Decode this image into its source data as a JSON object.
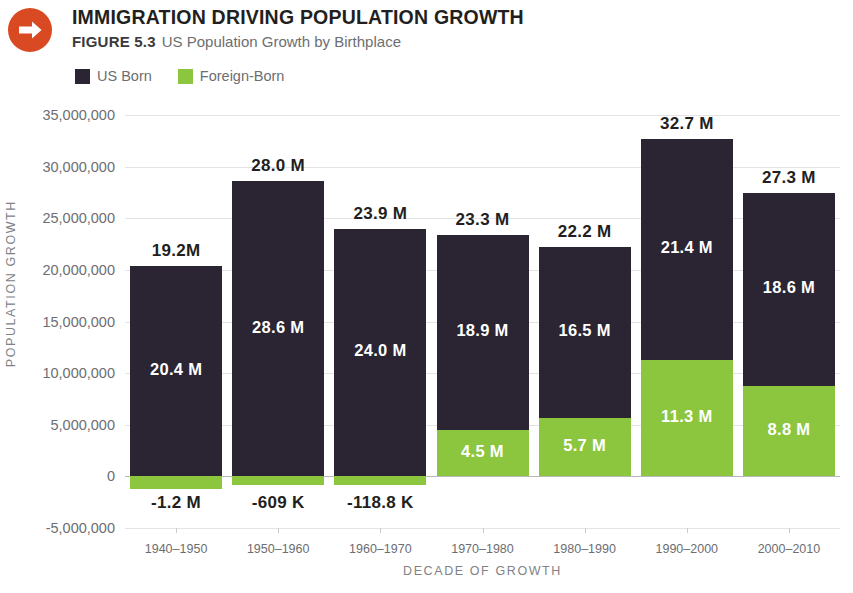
{
  "header": {
    "icon": "right-arrow-circle-icon",
    "title": "IMMIGRATION DRIVING POPULATION GROWTH",
    "figure_number": "FIGURE 5.3",
    "subtitle": "US Population Growth by Birthplace"
  },
  "legend": {
    "items": [
      {
        "label": "US Born",
        "color": "#2B2533"
      },
      {
        "label": "Foreign-Born",
        "color": "#8CC63F"
      }
    ]
  },
  "chart_data": {
    "type": "bar",
    "title": "IMMIGRATION DRIVING POPULATION GROWTH",
    "subtitle": "US Population Growth by Birthplace",
    "stacked": true,
    "xlabel": "DECADE OF GROWTH",
    "ylabel": "POPULATION GROWTH",
    "ylim": [
      -5000000,
      35000000
    ],
    "ytick_values": [
      -5000000,
      0,
      5000000,
      10000000,
      15000000,
      20000000,
      25000000,
      30000000,
      35000000
    ],
    "ytick_labels": [
      "-5,000,000",
      "0",
      "5,000,000",
      "10,000,000",
      "15,000,000",
      "20,000,000",
      "25,000,000",
      "30,000,000",
      "35,000,000"
    ],
    "grid": true,
    "legend_position": "top-left",
    "categories": [
      "1940–1950",
      "1950–1960",
      "1960–1970",
      "1970–1980",
      "1980–1990",
      "1990–2000",
      "2000–2010"
    ],
    "series": [
      {
        "name": "US Born",
        "color": "#2B2533",
        "values": [
          20400000,
          28600000,
          24000000,
          18900000,
          16500000,
          21400000,
          18600000
        ],
        "labels": [
          "20.4 M",
          "28.6 M",
          "24.0 M",
          "18.9 M",
          "16.5 M",
          "21.4 M",
          "18.6 M"
        ]
      },
      {
        "name": "Foreign-Born",
        "color": "#8CC63F",
        "values": [
          -1200000,
          -609000,
          -118800,
          4500000,
          5700000,
          11300000,
          8800000
        ],
        "labels": [
          "-1.2 M",
          "-609 K",
          "-118.8 K",
          "4.5 M",
          "5.7 M",
          "11.3 M",
          "8.8 M"
        ]
      }
    ],
    "totals": [
      19200000,
      28000000,
      23900000,
      23300000,
      22200000,
      32700000,
      27300000
    ],
    "total_labels": [
      "19.2M",
      "28.0 M",
      "23.9 M",
      "23.3 M",
      "22.2 M",
      "32.7 M",
      "27.3 M"
    ]
  },
  "colors": {
    "accent": "#D94A22",
    "us_born": "#2B2533",
    "foreign_born": "#8CC63F",
    "gridline": "#e3e3e6",
    "text": "#6d6e71"
  }
}
